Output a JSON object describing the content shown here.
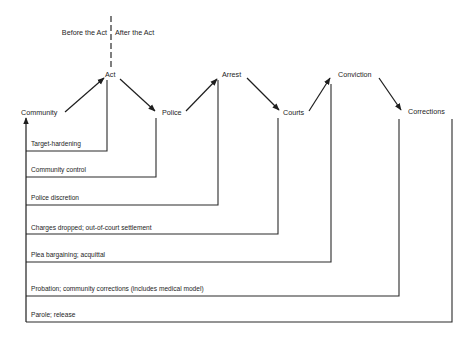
{
  "divider": {
    "before": "Before the Act",
    "after": "After the Act"
  },
  "nodes": {
    "community": "Community",
    "act": "Act",
    "police": "Police",
    "arrest": "Arrest",
    "courts": "Courts",
    "conviction": "Conviction",
    "corrections": "Corrections"
  },
  "feedback": [
    {
      "label": "Target-hardening",
      "from": "Act"
    },
    {
      "label": "Community control",
      "from": "Police"
    },
    {
      "label": "Police discretion",
      "from": "Arrest"
    },
    {
      "label": "Charges dropped; out-of-court settlement",
      "from": "Courts"
    },
    {
      "label": "Plea bargaining; acquittal",
      "from": "Conviction"
    },
    {
      "label": "Probation; community corrections (includes medical model)",
      "from": "Corrections"
    },
    {
      "label": "Parole; release",
      "from": "Corrections (after)"
    }
  ],
  "flow": [
    "Community",
    "Act",
    "Police",
    "Arrest",
    "Courts",
    "Conviction",
    "Corrections"
  ],
  "colors": {
    "line": "#2a2a2a",
    "text": "#1e1e1e",
    "background": "#ffffff"
  }
}
